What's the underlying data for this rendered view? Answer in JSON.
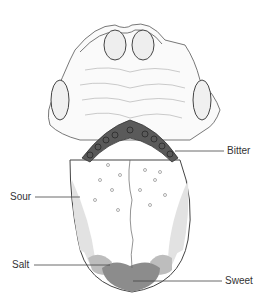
{
  "figure": {
    "labels": {
      "bitter": "Bitter",
      "sour": "Sour",
      "salt": "Salt",
      "sweet": "Sweet"
    },
    "colors": {
      "bitter": "#5a5a5a",
      "sour": "#e2e2e2",
      "salt": "#bdbdbd",
      "sweet": "#8c8c8c",
      "outline": "#444444"
    }
  }
}
